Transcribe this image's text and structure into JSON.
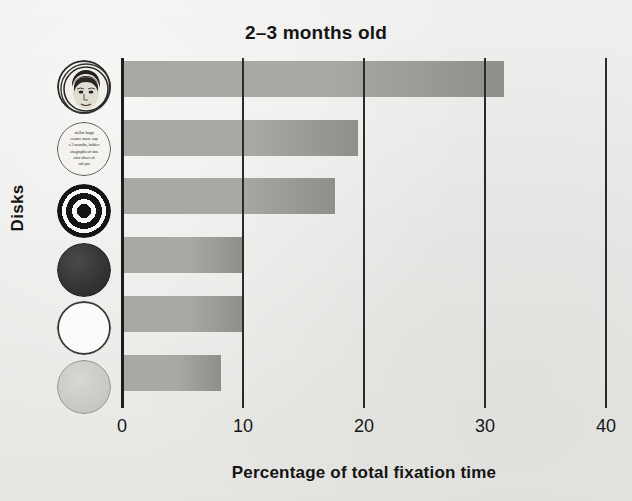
{
  "chart_data": {
    "type": "bar",
    "orientation": "horizontal",
    "title": "2–3 months old",
    "xlabel": "Percentage of total fixation time",
    "ylabel": "Disks",
    "categories": [
      "face",
      "printed text",
      "bull's-eye",
      "red",
      "white",
      "yellow"
    ],
    "values": [
      31.6,
      19.5,
      17.6,
      10.0,
      10.0,
      8.2
    ],
    "xlim": [
      0,
      40
    ],
    "ylim": null,
    "xticks": [
      "0",
      "10",
      "20",
      "30",
      "40"
    ],
    "xtick_values": [
      0,
      10,
      20,
      30,
      40
    ],
    "grid": true,
    "grid_axis": "x",
    "legend": null,
    "bar_fill": "#a8a8a4",
    "bar_fill_dark": "#8f8f8a",
    "axis_color": "#2b2b2b",
    "background": "#eeeeec",
    "text_color": "#141414"
  },
  "ticks": [
    {
      "label": "0",
      "value": 0
    },
    {
      "label": "10",
      "value": 10
    },
    {
      "label": "20",
      "value": 20
    },
    {
      "label": "30",
      "value": 30
    },
    {
      "label": "40",
      "value": 40
    }
  ],
  "bars": [
    {
      "icon": "face-disk-icon",
      "label": "face",
      "value": 31.6
    },
    {
      "icon": "printed-text-disk-icon",
      "label": "printed text",
      "value": 19.5
    },
    {
      "icon": "bullseye-disk-icon",
      "label": "bull's-eye",
      "value": 17.6
    },
    {
      "icon": "red-disk-icon",
      "label": "red",
      "value": 10.0
    },
    {
      "icon": "white-disk-icon",
      "label": "white",
      "value": 10.0
    },
    {
      "icon": "yellow-disk-icon",
      "label": "yellow",
      "value": 8.2
    }
  ],
  "newsprint": {
    "line1": "stellar happ",
    "line2": "ecome more sop",
    "line3": "s 3 months, babies",
    "line4": "otographs of stra",
    "line5": "olor slices of",
    "line6": "ual pat"
  }
}
